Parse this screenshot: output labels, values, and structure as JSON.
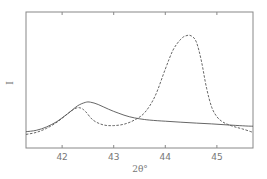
{
  "chart_data": {
    "type": "line",
    "title": "",
    "xlabel": "2θ°",
    "ylabel": "I",
    "xlim": [
      41.3,
      45.7
    ],
    "ylim": [
      0,
      100
    ],
    "grid": false,
    "legend": "none",
    "xticks": [
      42,
      43,
      44,
      45
    ],
    "xtick_labels": [
      "42",
      "43",
      "44",
      "45"
    ],
    "series": [
      {
        "name": "solid",
        "style": "solid",
        "color": "#555555",
        "x": [
          41.3,
          41.5,
          41.7,
          41.9,
          42.1,
          42.3,
          42.45,
          42.55,
          42.7,
          42.9,
          43.1,
          43.3,
          43.5,
          43.7,
          44.0,
          44.3,
          44.6,
          44.9,
          45.2,
          45.5,
          45.7
        ],
        "y": [
          12,
          13,
          15.5,
          19.5,
          25,
          31,
          33.5,
          33.7,
          32,
          28.5,
          25.5,
          23,
          21.5,
          20.5,
          19.7,
          19,
          18.3,
          17.7,
          17,
          16.3,
          16
        ]
      },
      {
        "name": "dashed",
        "style": "dashed",
        "color": "#555555",
        "x": [
          41.3,
          41.5,
          41.7,
          41.9,
          42.1,
          42.25,
          42.35,
          42.45,
          42.6,
          42.8,
          43.0,
          43.2,
          43.4,
          43.6,
          43.8,
          44.0,
          44.15,
          44.3,
          44.4,
          44.5,
          44.6,
          44.7,
          44.8,
          44.9,
          45.0,
          45.1,
          45.2,
          45.35,
          45.5,
          45.7
        ],
        "y": [
          10,
          11.5,
          14.5,
          19,
          25,
          29,
          29.5,
          27,
          20.5,
          17,
          16.5,
          17.5,
          20.5,
          26,
          38,
          58,
          72,
          80,
          82.5,
          82.5,
          78,
          64,
          44,
          30,
          23,
          19.5,
          17.5,
          15.5,
          14,
          11.5
        ]
      }
    ]
  }
}
